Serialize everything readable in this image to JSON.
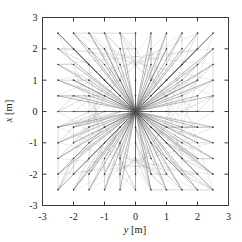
{
  "chart_data": {
    "type": "scatter",
    "title": "",
    "subtitle": "",
    "xlabel": "y [m]",
    "ylabel": "x [m]",
    "xlim": [
      -3,
      3
    ],
    "ylim": [
      -3,
      3
    ],
    "xticks": [
      -3,
      -2,
      -1,
      0,
      1,
      2,
      3
    ],
    "yticks": [
      -3,
      -2,
      -1,
      0,
      1,
      2,
      3
    ],
    "xticklabels": [
      "-3",
      "-2",
      "-1",
      "0",
      "1",
      "2",
      "3"
    ],
    "yticklabels": [
      "-3",
      "-2",
      "-1",
      "0",
      "1",
      "2",
      "3"
    ],
    "grid": false,
    "legend": null,
    "node_grid": {
      "description": "regular square lattice of node markers",
      "spacing": 0.5,
      "x_range": [
        -2.5,
        2.5
      ],
      "y_range": [
        -2.5,
        2.5
      ],
      "marker": "dot",
      "marker_color": "#2b2b2b",
      "marker_size_px": 1.6,
      "count": 121
    },
    "edges": {
      "description": "straight line segments connecting the centre node at the origin and its neighbours to every lattice node, forming a dense radial star / spider-web",
      "hub": [
        0,
        0
      ],
      "line_color": "#555555",
      "line_width_px": 0.45,
      "count_approx": 600
    },
    "axis_color": "#3a3a3a",
    "background": "#ffffff"
  },
  "figure": {
    "xlabel": "y [m]",
    "ylabel": "x [m]",
    "xlabel_var": "y",
    "xlabel_unit": "[m]",
    "ylabel_var": "x",
    "ylabel_unit": "[m]"
  }
}
